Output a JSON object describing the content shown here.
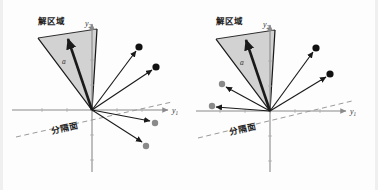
{
  "figure": {
    "title_text": "",
    "background_color": "#fdfdfd",
    "width": 378,
    "height": 190
  },
  "labels": {
    "solution_region": "解区域",
    "separating_plane": "分隔面",
    "weight_vector": "a",
    "axis_y1_base": "y",
    "axis_y1_sub": "1",
    "axis_y2_base": "y",
    "axis_y2_sub": "2"
  },
  "colors": {
    "cone_fill": "#b8b8b8",
    "cone_edge": "#1a1a1a",
    "axis": "#8a8a8a",
    "vector_line": "#1a1a1a",
    "dashed_line": "#9a9a9a",
    "dot_black": "#111111",
    "dot_gray": "#8a8a8a",
    "text": "#1c1c1c",
    "background": "#fdfdfd"
  },
  "panels": [
    {
      "id": "left-panel",
      "name": "panel-original-samples",
      "origin": {
        "x": 92,
        "y": 110
      },
      "axes": {
        "y1_start": {
          "x": 12,
          "y": 110
        },
        "y1_end": {
          "x": 170,
          "y": 110
        },
        "y2_start": {
          "x": 92,
          "y": 172
        },
        "y2_end": {
          "x": 92,
          "y": 22
        },
        "y1_label_pos": {
          "x": 172,
          "y": 112
        },
        "y2_label_pos": {
          "x": 87,
          "y": 24
        }
      },
      "dashed_line": {
        "start": {
          "x": 16,
          "y": 137
        },
        "end": {
          "x": 172,
          "y": 102
        }
      },
      "cone": {
        "apex": {
          "x": 92,
          "y": 110
        },
        "left": {
          "x": 38,
          "y": 38
        },
        "right": {
          "x": 97,
          "y": 29
        },
        "fill": "#b8b8b8",
        "opacity": 0.62
      },
      "weight_vector": {
        "from": {
          "x": 92,
          "y": 110
        },
        "to": {
          "x": 66,
          "y": 33
        },
        "label_pos": {
          "x": 66,
          "y": 62
        }
      },
      "solution_region_label_pos": {
        "x": 38,
        "y": 22
      },
      "separating_plane_label_pos": {
        "x": 52,
        "y": 132
      },
      "samples": [
        {
          "name": "sample-1",
          "to": {
            "x": 139,
            "y": 47
          },
          "color": "#111111",
          "class": "positive"
        },
        {
          "name": "sample-2",
          "to": {
            "x": 156,
            "y": 67
          },
          "color": "#111111",
          "class": "positive"
        },
        {
          "name": "sample-3",
          "to": {
            "x": 155,
            "y": 123
          },
          "color": "#8a8a8a",
          "class": "negative"
        },
        {
          "name": "sample-4",
          "to": {
            "x": 146,
            "y": 146
          },
          "color": "#8a8a8a",
          "class": "negative"
        }
      ]
    },
    {
      "id": "right-panel",
      "name": "panel-normalized-samples",
      "origin": {
        "x": 270,
        "y": 111
      },
      "axes": {
        "y1_start": {
          "x": 196,
          "y": 111
        },
        "y1_end": {
          "x": 348,
          "y": 111
        },
        "y2_start": {
          "x": 270,
          "y": 172
        },
        "y2_end": {
          "x": 270,
          "y": 22
        },
        "y1_label_pos": {
          "x": 350,
          "y": 113
        },
        "y2_label_pos": {
          "x": 265,
          "y": 24
        }
      },
      "dashed_line": {
        "start": {
          "x": 198,
          "y": 138
        },
        "end": {
          "x": 352,
          "y": 101
        }
      },
      "cone": {
        "apex": {
          "x": 270,
          "y": 111
        },
        "left": {
          "x": 216,
          "y": 39
        },
        "right": {
          "x": 275,
          "y": 30
        },
        "fill": "#b8b8b8",
        "opacity": 0.62
      },
      "weight_vector": {
        "from": {
          "x": 270,
          "y": 111
        },
        "to": {
          "x": 244,
          "y": 34
        },
        "label_pos": {
          "x": 244,
          "y": 63
        }
      },
      "solution_region_label_pos": {
        "x": 216,
        "y": 22
      },
      "separating_plane_label_pos": {
        "x": 230,
        "y": 133
      },
      "samples": [
        {
          "name": "sample-1",
          "to": {
            "x": 316,
            "y": 48
          },
          "color": "#111111",
          "class": "positive"
        },
        {
          "name": "sample-2",
          "to": {
            "x": 330,
            "y": 74
          },
          "color": "#111111",
          "class": "positive"
        },
        {
          "name": "sample-3",
          "to": {
            "x": 222,
            "y": 84
          },
          "color": "#8a8a8a",
          "class": "negative"
        },
        {
          "name": "sample-4",
          "to": {
            "x": 212,
            "y": 106
          },
          "color": "#8a8a8a",
          "class": "negative"
        }
      ]
    }
  ]
}
